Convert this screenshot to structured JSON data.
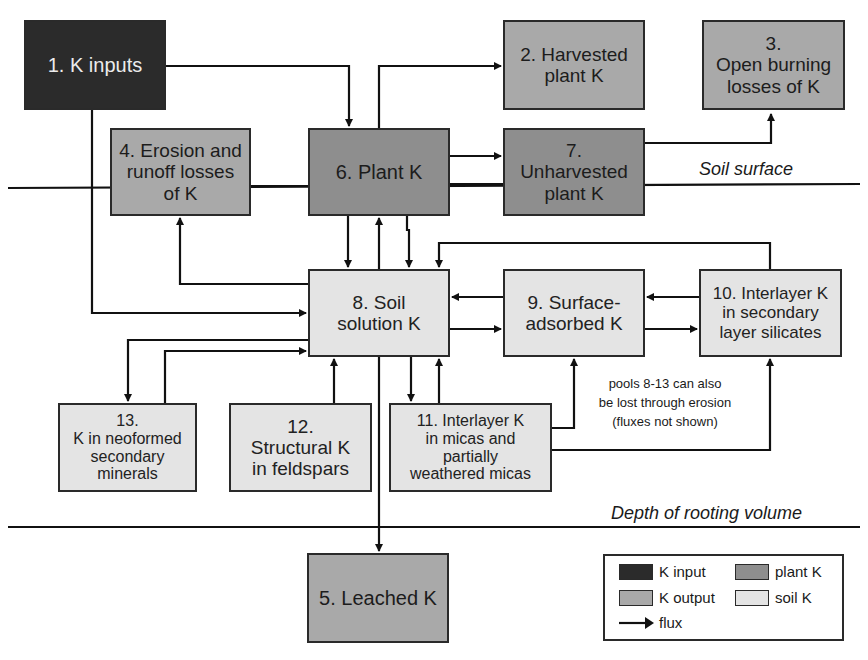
{
  "diagram": {
    "boxes": [
      {
        "id": 1,
        "lines": [
          "1. K inputs"
        ],
        "category": "K input"
      },
      {
        "id": 2,
        "lines": [
          "2. Harvested",
          "plant K"
        ],
        "category": "K output"
      },
      {
        "id": 3,
        "lines": [
          "3.",
          "Open burning",
          "losses of  K"
        ],
        "category": "K output"
      },
      {
        "id": 4,
        "lines": [
          "4. Erosion and",
          "runoff losses",
          "of K"
        ],
        "category": "K output"
      },
      {
        "id": 5,
        "lines": [
          "5. Leached K"
        ],
        "category": "K output"
      },
      {
        "id": 6,
        "lines": [
          "6. Plant K"
        ],
        "category": "plant K"
      },
      {
        "id": 7,
        "lines": [
          "7.",
          "Unharvested",
          "plant K"
        ],
        "category": "plant K"
      },
      {
        "id": 8,
        "lines": [
          "8. Soil",
          "solution K"
        ],
        "category": "soil K"
      },
      {
        "id": 9,
        "lines": [
          "9. Surface-",
          "adsorbed K"
        ],
        "category": "soil K"
      },
      {
        "id": 10,
        "lines": [
          "10. Interlayer K",
          "in secondary",
          "layer silicates"
        ],
        "category": "soil K"
      },
      {
        "id": 11,
        "lines": [
          "11. Interlayer K",
          "in micas and",
          "partially",
          "weathered micas"
        ],
        "category": "soil K"
      },
      {
        "id": 12,
        "lines": [
          "12.",
          "Structural K",
          "in feldspars"
        ],
        "category": "soil K"
      },
      {
        "id": 13,
        "lines": [
          "13.",
          "K in neoformed",
          "secondary",
          "minerals"
        ],
        "category": "soil K"
      }
    ],
    "flux_edges": [
      [
        "1",
        "6"
      ],
      [
        "1",
        "8"
      ],
      [
        "6",
        "2"
      ],
      [
        "6",
        "7"
      ],
      [
        "6",
        "8"
      ],
      [
        "8",
        "6"
      ],
      [
        "7",
        "3"
      ],
      [
        "7",
        "8"
      ],
      [
        "8",
        "4"
      ],
      [
        "8",
        "9"
      ],
      [
        "9",
        "8"
      ],
      [
        "9",
        "10"
      ],
      [
        "10",
        "9"
      ],
      [
        "10",
        "8"
      ],
      [
        "8",
        "13"
      ],
      [
        "13",
        "8"
      ],
      [
        "12",
        "8"
      ],
      [
        "8",
        "11"
      ],
      [
        "11",
        "8"
      ],
      [
        "11",
        "9"
      ],
      [
        "11",
        "10"
      ],
      [
        "8",
        "5"
      ]
    ],
    "layers": {
      "soil_surface": "Soil surface",
      "rooting_depth": "Depth of rooting volume"
    },
    "note": [
      "pools 8-13 can also",
      "be lost through erosion",
      "(fluxes not shown)"
    ],
    "legend": {
      "items": [
        {
          "label": "K input",
          "color": "#2b2b2b"
        },
        {
          "label": "plant K",
          "color": "#8e8e8e"
        },
        {
          "label": "K output",
          "color": "#a9a9a9"
        },
        {
          "label": "soil K",
          "color": "#e4e4e4"
        }
      ],
      "flux_label": "flux"
    },
    "caption_partial": "(text cut off at bottom edge)"
  }
}
